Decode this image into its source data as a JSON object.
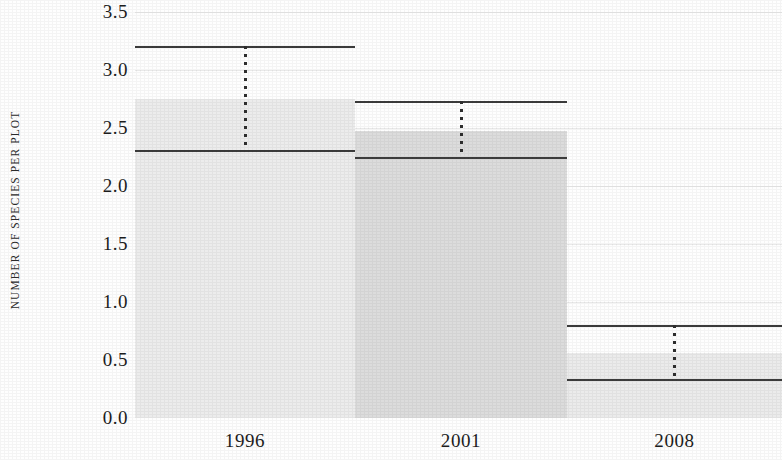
{
  "chart_data": {
    "type": "bar",
    "title": "",
    "subtitle": "",
    "xlabel": "",
    "ylabel": "NUMBER OF SPECIES PER PLOT",
    "categories": [
      "1996",
      "2001",
      "2008"
    ],
    "values": [
      2.75,
      2.47,
      0.56
    ],
    "series": [
      {
        "name": "Number of species per plot",
        "values": [
          2.75,
          2.47,
          0.56
        ]
      }
    ],
    "overlay_lines": {
      "description": "Each bar carries a dotted vertical error-bar stem spanning a lower mean line and an upper cap line.",
      "mean_values": [
        2.31,
        2.25,
        0.34
      ],
      "upper_cap_values": [
        3.21,
        2.73,
        0.8
      ]
    },
    "ylim": [
      0.0,
      3.5
    ],
    "xlim": [
      0,
      3
    ],
    "yticks": [
      0.0,
      0.5,
      1.0,
      1.5,
      2.0,
      2.5,
      3.0,
      3.5
    ],
    "ytick_labels": [
      "0.0",
      "0.5",
      "1.0",
      "1.5",
      "2.0",
      "2.5",
      "3.0",
      "3.5"
    ],
    "grid": true,
    "grid_axis": "y",
    "legend": false,
    "legend_position": "none",
    "bar_colors": [
      "#ececec",
      "#dcdcdc",
      "#ebebeb"
    ],
    "line_color": "#3c3c3c",
    "grid_color": "#e9e9e9",
    "background_color": "#fefefe",
    "annotations": []
  },
  "axis": {
    "y_title": "NUMBER OF SPECIES PER PLOT"
  }
}
